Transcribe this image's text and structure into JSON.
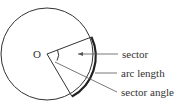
{
  "diagram": {
    "center_label": "O",
    "labels": {
      "sector": "sector",
      "arc_length": "arc length",
      "sector_angle": "sector angle"
    },
    "colors": {
      "stroke": "#333333",
      "text": "#333333",
      "background": "#ffffff"
    }
  }
}
